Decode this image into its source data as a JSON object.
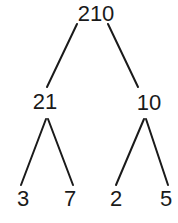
{
  "diagram": {
    "type": "factor-tree",
    "line_color": "#1a1a1a",
    "text_color": "#1a1a1a",
    "root": {
      "label": "210"
    },
    "level1": [
      {
        "label": "21"
      },
      {
        "label": "10"
      }
    ],
    "level2": [
      {
        "label": "3"
      },
      {
        "label": "7"
      },
      {
        "label": "2"
      },
      {
        "label": "5"
      }
    ],
    "edges": [
      {
        "from": "210",
        "to": "21"
      },
      {
        "from": "210",
        "to": "10"
      },
      {
        "from": "21",
        "to": "3"
      },
      {
        "from": "21",
        "to": "7"
      },
      {
        "from": "10",
        "to": "2"
      },
      {
        "from": "10",
        "to": "5"
      }
    ]
  }
}
